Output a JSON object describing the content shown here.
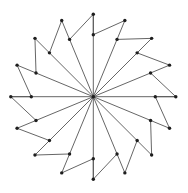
{
  "diagram": {
    "type": "star-graph",
    "center": [
      93.3,
      96.7
    ],
    "spoke_count": 16,
    "inner_radius": 62,
    "outer_radius": 82.5,
    "angle_step_deg": 22.5,
    "start_angle_deg": -90,
    "colors": {
      "line": "#555555",
      "node": "#1e1e1e",
      "background": "#ffffff"
    },
    "node_radius": 1.7,
    "edges_rule": [
      "center -> inner[k]",
      "inner[k] -> outer[k+1]",
      "outer[k+1] -> inner[k+1]",
      "outer[0] -> inner[0] (collinear with center)"
    ]
  }
}
